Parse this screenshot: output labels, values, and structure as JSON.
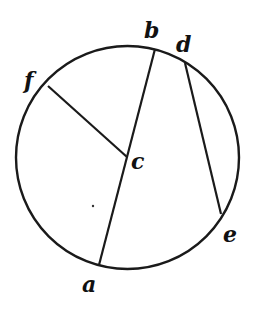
{
  "diagram": {
    "type": "circle-chords",
    "stroke_color": "#1a1a1a",
    "background": "#ffffff",
    "circle": {
      "cx": 127.5,
      "cy": 157.5,
      "r": 111.5
    },
    "points": {
      "a": {
        "x": 99,
        "y": 265
      },
      "b": {
        "x": 155,
        "y": 49
      },
      "c": {
        "x": 127,
        "y": 157
      },
      "d": {
        "x": 185,
        "y": 63
      },
      "e": {
        "x": 221,
        "y": 214
      },
      "f": {
        "x": 48,
        "y": 86
      }
    },
    "segments": [
      {
        "from": "b",
        "to": "a",
        "name": "diameter-ba"
      },
      {
        "from": "f",
        "to": "c",
        "name": "radius-fc"
      },
      {
        "from": "d",
        "to": "e",
        "name": "chord-de"
      }
    ],
    "labels": [
      {
        "text": "a",
        "x": 82,
        "y": 292
      },
      {
        "text": "b",
        "x": 144,
        "y": 38
      },
      {
        "text": "c",
        "x": 131,
        "y": 169
      },
      {
        "text": "d",
        "x": 176,
        "y": 52
      },
      {
        "text": "e",
        "x": 223,
        "y": 242
      },
      {
        "text": "f",
        "x": 24,
        "y": 88
      }
    ]
  }
}
